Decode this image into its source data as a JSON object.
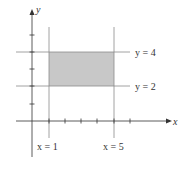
{
  "diagram": {
    "type": "region-on-coordinate-plane",
    "axes": {
      "x_label": "x",
      "y_label": "y"
    },
    "lines": {
      "vertical_left": {
        "label": "x = 1",
        "value": 1
      },
      "vertical_right": {
        "label": "x = 5",
        "value": 5
      },
      "horizontal_top": {
        "label": "y = 4",
        "value": 4
      },
      "horizontal_bottom": {
        "label": "y = 2",
        "value": 2
      }
    },
    "shaded_region": {
      "x_range": [
        1,
        5
      ],
      "y_range": [
        2,
        4
      ],
      "fill_color": "#c8c8c8"
    },
    "x_ticks": [
      1,
      2,
      3,
      4,
      5,
      6
    ],
    "y_ticks": [
      1,
      2,
      3,
      4,
      5
    ],
    "colors": {
      "axis": "#333333",
      "line": "#888888",
      "shade": "#c8c8c8"
    }
  }
}
